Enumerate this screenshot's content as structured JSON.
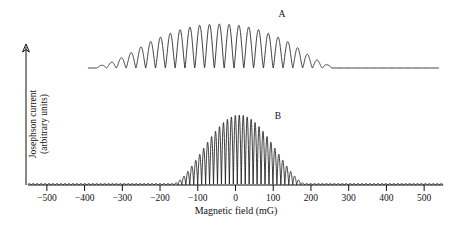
{
  "figure": {
    "background_color": "#ffffff",
    "curve_color": "#1a1a1a",
    "axis_color": "#111111"
  },
  "axes": {
    "y_label_line1": "Josephson current",
    "y_label_line2": "(arbitrary units)",
    "x_label": "Magnetic field (mG)",
    "x_tick_labels": [
      "−500",
      "−400",
      "−300",
      "−200",
      "−100",
      "0",
      "100",
      "200",
      "300",
      "400",
      "500"
    ]
  },
  "labels": {
    "curve_a": "A",
    "curve_b": "B"
  },
  "chart_data": {
    "type": "line",
    "title": "",
    "xlabel": "Magnetic field (mG)",
    "ylabel": "Josephson current (arbitrary units)",
    "xlim": [
      -550,
      550
    ],
    "xticks": [
      -500,
      -400,
      -300,
      -200,
      -100,
      0,
      100,
      200,
      300,
      400,
      500
    ],
    "grid": false,
    "legend": "inline-annotations",
    "series": [
      {
        "name": "A",
        "annotation": "A",
        "annotation_x": 55,
        "description": "Single-junction Fraunhofer-like Josephson interference pattern: slow oscillations with cusped minima under a broad envelope.",
        "envelope_center_mG": 15,
        "envelope_half_width_mG": 235,
        "oscillation_period_mG": 26,
        "n_peaks": 24,
        "baseline_value": 0,
        "peak_value": 1.0,
        "x_start_mG": -390,
        "x_end_mG": 540,
        "peaks_mG": [
          -355,
          -329,
          -303,
          -277,
          -251,
          -225,
          -199,
          -173,
          -147,
          -121,
          -95,
          -69,
          -43,
          -17,
          9,
          35,
          61,
          87,
          113,
          139,
          165,
          191,
          217,
          243
        ],
        "peak_values": [
          0.06,
          0.13,
          0.23,
          0.35,
          0.48,
          0.6,
          0.7,
          0.79,
          0.87,
          0.93,
          0.97,
          0.99,
          1.0,
          0.99,
          0.97,
          0.93,
          0.87,
          0.79,
          0.7,
          0.6,
          0.46,
          0.31,
          0.18,
          0.07
        ]
      },
      {
        "name": "B",
        "annotation": "B",
        "annotation_x": 50,
        "description": "Two-junction SQUID interference: rapid oscillations modulated by a smooth single-slit diffraction dome centred near zero field.",
        "envelope_center_mG": 10,
        "envelope_half_width_mG": 175,
        "oscillation_period_mG": 10.5,
        "n_peaks": 45,
        "baseline_value": 0,
        "peak_value": 1.0,
        "x_start_mG": -550,
        "x_end_mG": 550,
        "dome_start_mG": -285,
        "dome_end_mG": 300,
        "baseline_ripple_amplitude": 0.02
      }
    ]
  }
}
